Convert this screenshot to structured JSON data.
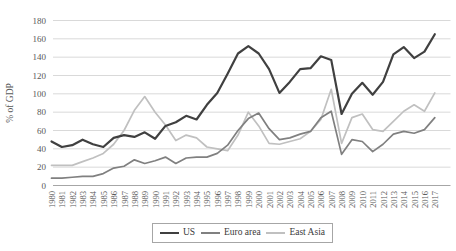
{
  "chart_data": {
    "type": "line",
    "title": "",
    "ylabel": "% of GDP",
    "ylim": [
      0,
      180
    ],
    "yticks": [
      0,
      20,
      40,
      60,
      80,
      100,
      120,
      140,
      160,
      180
    ],
    "grid": true,
    "legend_position": "bottom",
    "gridline_color": "#d9d9d9",
    "axis_line_color": "#a6a6a6",
    "tick_label_color": "#595959",
    "legend_border_color": "#a6a6a6",
    "x": [
      1980,
      1981,
      1982,
      1983,
      1984,
      1985,
      1986,
      1987,
      1988,
      1989,
      1990,
      1991,
      1992,
      1993,
      1994,
      1995,
      1996,
      1997,
      1998,
      1999,
      2000,
      2001,
      2002,
      2003,
      2004,
      2005,
      2006,
      2007,
      2008,
      2009,
      2010,
      2011,
      2012,
      2013,
      2014,
      2015,
      2016,
      2017
    ],
    "series": [
      {
        "name": "US",
        "color": "#404040",
        "stroke_width": 2.2,
        "values": [
          48,
          42,
          44,
          50,
          45,
          42,
          52,
          55,
          53,
          58,
          51,
          65,
          69,
          76,
          72,
          88,
          101,
          122,
          144,
          152,
          144,
          127,
          101,
          113,
          127,
          128,
          141,
          137,
          78,
          100,
          112,
          99,
          113,
          143,
          151,
          139,
          146,
          165
        ]
      },
      {
        "name": "Euro area",
        "color": "#808080",
        "stroke_width": 1.7,
        "values": [
          8,
          8,
          9,
          10,
          10,
          13,
          19,
          21,
          28,
          24,
          27,
          31,
          24,
          30,
          31,
          31,
          35,
          44,
          60,
          73,
          79,
          62,
          50,
          52,
          56,
          59,
          74,
          81,
          34,
          50,
          48,
          37,
          45,
          56,
          59,
          57,
          61,
          74
        ]
      },
      {
        "name": "East Asia",
        "color": "#c0c0c0",
        "stroke_width": 1.7,
        "values": [
          22,
          22,
          22,
          26,
          30,
          35,
          45,
          60,
          82,
          97,
          80,
          66,
          49,
          55,
          52,
          42,
          40,
          38,
          55,
          80,
          65,
          46,
          45,
          48,
          51,
          59,
          72,
          105,
          46,
          74,
          78,
          61,
          59,
          70,
          81,
          88,
          81,
          101
        ]
      }
    ]
  }
}
